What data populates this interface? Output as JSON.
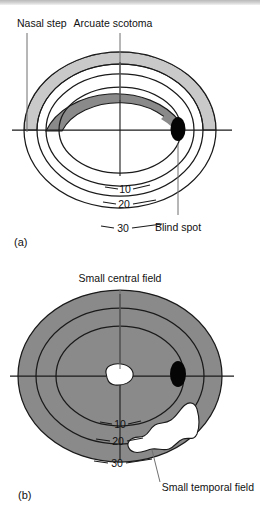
{
  "figure": {
    "kind": "visual-field-defect-diagram",
    "panels": [
      {
        "id": "a",
        "panel_label": "(a)",
        "isopters": [
          "10",
          "20",
          "30"
        ],
        "annotations": [
          {
            "name": "nasal-step",
            "label": "Nasal step"
          },
          {
            "name": "arcuate-scotoma",
            "label": "Arcuate scotoma"
          },
          {
            "name": "blind-spot",
            "label": "Blind spot"
          }
        ],
        "colors": {
          "light_gray_defect": "#c9c9c9",
          "dark_gray_defect": "#8a8a8a",
          "blind_spot": "#050505",
          "contour": "#1a1a1a",
          "background": "#ffffff",
          "leader": "#6f6f6f"
        }
      },
      {
        "id": "b",
        "panel_label": "(b)",
        "isopters": [
          "10",
          "20",
          "30"
        ],
        "annotations": [
          {
            "name": "small-central-field",
            "label": "Small central field"
          },
          {
            "name": "small-temporal-field",
            "label": "Small temporal field"
          }
        ],
        "colors": {
          "field_loss_gray": "#8a8a8a",
          "residual_island": "#ffffff",
          "blind_spot": "#050505",
          "contour": "#1a1a1a",
          "background": "#ffffff",
          "leader": "#6f6f6f"
        }
      }
    ]
  },
  "panel_a": {
    "label": "(a)",
    "nasal_step": "Nasal step",
    "arcuate_scotoma": "Arcuate scotoma",
    "blind_spot": "Blind spot",
    "iso_10": "10",
    "iso_20": "20",
    "iso_30": "30"
  },
  "panel_b": {
    "label": "(b)",
    "small_central_field": "Small central field",
    "small_temporal_field": "Small temporal field",
    "iso_10": "10",
    "iso_20": "20",
    "iso_30": "30"
  }
}
